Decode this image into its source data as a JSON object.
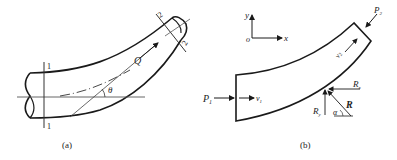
{
  "figure_a": {
    "caption": "(a)",
    "section1_top": "1",
    "section1_bottom": "1",
    "section2_top": "2",
    "section2_bottom": "2",
    "flow_label": "Q",
    "angle_label": "θ"
  },
  "figure_b": {
    "caption": "(b)",
    "axis_y": "y",
    "axis_x": "x",
    "origin": "o",
    "pressure_in": "P",
    "pressure_in_sub": "1",
    "velocity_in": "v",
    "velocity_in_sub": "1",
    "pressure_out": "P",
    "pressure_out_sub": "2",
    "velocity_out": "v",
    "velocity_out_sub": "2",
    "reaction_x": "R",
    "reaction_x_sub": "x",
    "reaction_y": "R",
    "reaction_y_sub": "y",
    "reaction_total": "R",
    "reaction_angle": "α"
  },
  "colors": {
    "stroke": "#1a1a1a",
    "thin": "#555555"
  }
}
